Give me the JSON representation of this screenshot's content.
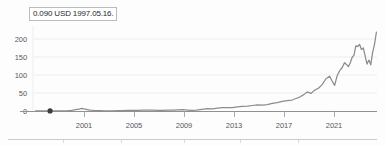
{
  "tooltip": {
    "label": "0.090 USD 1997.05.16.",
    "value": 0.09,
    "currency": "USD",
    "date": "1997.05.16."
  },
  "chart_data": {
    "type": "line",
    "title": "",
    "subtitle": "",
    "xlabel": "",
    "ylabel": "",
    "grid": true,
    "legend_position": "none",
    "line_color": "#8a8d90",
    "marker_color": "#3a3d40",
    "axis_color": "#8e9193",
    "gridline_color": "#ededed",
    "xlim": [
      1996.0,
      2023.6
    ],
    "ylim": [
      0,
      232
    ],
    "x_ticks": [
      2001,
      2005,
      2009,
      2013,
      2017,
      2021
    ],
    "x_tick_labels": [
      "2001",
      "2005",
      "2009",
      "2013",
      "2017",
      "2021"
    ],
    "y_ticks": [
      0,
      50,
      100,
      150,
      200
    ],
    "y_tick_labels": [
      "0",
      "50",
      "100",
      "150",
      "200"
    ],
    "highlight_point": {
      "x": 1997.37,
      "y": 0.09,
      "label": "0.090 USD 1997.05.16."
    },
    "series": [
      {
        "name": "Price (USD)",
        "x": [
          1996.2,
          1996.6,
          1997.0,
          1997.37,
          1997.7,
          1998.0,
          1998.4,
          1998.8,
          1999.1,
          1999.4,
          1999.7,
          1999.9,
          2000.1,
          2000.35,
          2000.6,
          2000.85,
          2001.1,
          2001.4,
          2001.7,
          2002.0,
          2002.4,
          2002.8,
          2003.2,
          2003.6,
          2004.0,
          2004.4,
          2004.8,
          2005.2,
          2005.6,
          2006.0,
          2006.4,
          2006.8,
          2007.2,
          2007.6,
          2008.0,
          2008.4,
          2008.8,
          2009.1,
          2009.4,
          2009.7,
          2010.0,
          2010.4,
          2010.8,
          2011.2,
          2011.6,
          2012.0,
          2012.4,
          2012.8,
          2013.2,
          2013.6,
          2014.0,
          2014.4,
          2014.8,
          2015.2,
          2015.6,
          2016.0,
          2016.4,
          2016.8,
          2017.1,
          2017.4,
          2017.7,
          2018.0,
          2018.3,
          2018.6,
          2018.9,
          2019.2,
          2019.5,
          2019.8,
          2020.0,
          2020.2,
          2020.4,
          2020.6,
          2020.8,
          2021.0,
          2021.15,
          2021.3,
          2021.45,
          2021.6,
          2021.75,
          2021.9,
          2022.05,
          2022.2,
          2022.35,
          2022.5,
          2022.65,
          2022.8,
          2022.95,
          2023.1,
          2023.25,
          2023.4,
          2023.55
        ],
        "values": [
          0.1,
          0.1,
          0.1,
          0.09,
          0.2,
          0.4,
          0.6,
          1.2,
          2.0,
          3.5,
          5.0,
          7.0,
          5.5,
          4.0,
          2.5,
          1.6,
          1.0,
          0.8,
          0.6,
          0.5,
          0.45,
          0.7,
          1.1,
          1.5,
          1.8,
          2.0,
          2.2,
          2.1,
          2.3,
          2.0,
          1.9,
          2.2,
          2.5,
          3.2,
          3.6,
          2.6,
          1.8,
          2.2,
          3.5,
          5.0,
          6.3,
          5.8,
          8.0,
          9.5,
          9.0,
          9.5,
          11.0,
          12.5,
          13.5,
          15.0,
          16.5,
          16.0,
          17.5,
          21.0,
          23.0,
          26.0,
          28.0,
          30.0,
          34.0,
          38.0,
          44.0,
          52.0,
          48.0,
          57.0,
          62.0,
          72.0,
          88.0,
          95.0,
          82.0,
          70.0,
          96.0,
          110.0,
          118.0,
          132.0,
          127.0,
          121.0,
          131.0,
          146.0,
          152.0,
          178.0,
          176.0,
          182.0,
          168.0,
          172.0,
          150.0,
          128.0,
          139.0,
          126.0,
          160.0,
          182.0,
          215.0
        ]
      }
    ]
  }
}
